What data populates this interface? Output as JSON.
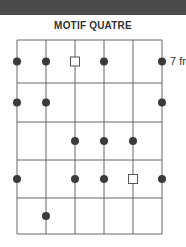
{
  "header": {
    "band_color": "#4a4a4a"
  },
  "title": "MOTIF QUATRE",
  "fret_label": "7 fr",
  "grid": {
    "strings_x": [
      17,
      46,
      75,
      104,
      133,
      162
    ],
    "frets_y": [
      40,
      83,
      122,
      160,
      198,
      234
    ],
    "line_color": "#666666"
  },
  "markers": [
    {
      "string": 0,
      "fret": 0,
      "type": "dot"
    },
    {
      "string": 1,
      "fret": 0,
      "type": "dot"
    },
    {
      "string": 2,
      "fret": 0,
      "type": "square"
    },
    {
      "string": 3,
      "fret": 0,
      "type": "dot"
    },
    {
      "string": 5,
      "fret": 0,
      "type": "dot"
    },
    {
      "string": 0,
      "fret": 1,
      "type": "dot"
    },
    {
      "string": 1,
      "fret": 1,
      "type": "dot"
    },
    {
      "string": 5,
      "fret": 1,
      "type": "dot"
    },
    {
      "string": 2,
      "fret": 2,
      "type": "dot"
    },
    {
      "string": 3,
      "fret": 2,
      "type": "dot"
    },
    {
      "string": 4,
      "fret": 2,
      "type": "dot"
    },
    {
      "string": 0,
      "fret": 3,
      "type": "dot"
    },
    {
      "string": 2,
      "fret": 3,
      "type": "dot"
    },
    {
      "string": 3,
      "fret": 3,
      "type": "dot"
    },
    {
      "string": 4,
      "fret": 3,
      "type": "square"
    },
    {
      "string": 5,
      "fret": 3,
      "type": "dot"
    },
    {
      "string": 1,
      "fret": 4,
      "type": "dot"
    }
  ],
  "dot_color": "#3a3a3a"
}
